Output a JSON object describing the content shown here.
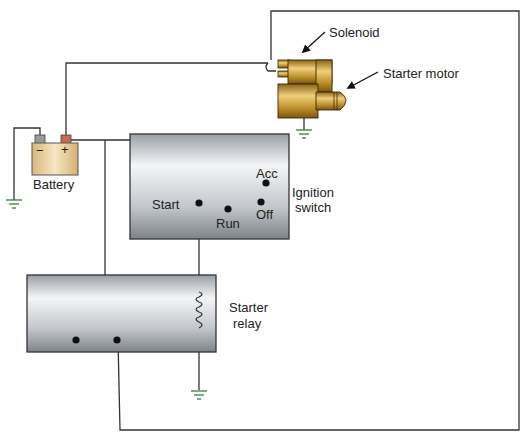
{
  "diagram": {
    "type": "starting-system-wiring",
    "components": {
      "battery": {
        "label": "Battery",
        "neg": "−",
        "pos": "+"
      },
      "solenoid": {
        "label": "Solenoid"
      },
      "starter_motor": {
        "label": "Starter motor"
      },
      "ignition_switch": {
        "label_line1": "Ignition",
        "label_line2": "switch",
        "positions": {
          "start": "Start",
          "run": "Run",
          "off": "Off",
          "acc": "Acc"
        }
      },
      "starter_relay": {
        "label_line1": "Starter",
        "label_line2": "relay"
      }
    },
    "colors": {
      "wire": "#333333",
      "ground": "#3a7a3a",
      "box_light": "#f2f3f5",
      "box_dark": "#8e949b",
      "copper": "#c79a3c",
      "battery_fill": "#e8cc98"
    }
  }
}
